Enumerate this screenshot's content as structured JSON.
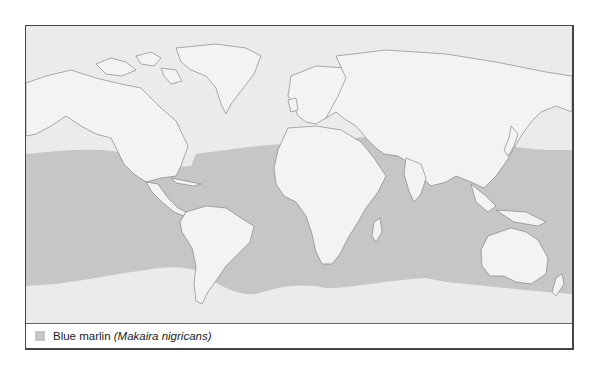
{
  "map": {
    "title": "",
    "colors": {
      "ocean": "#ebebeb",
      "range": "#c6c6c6",
      "land": "#f3f3f3",
      "coast": "#777777"
    }
  },
  "legend": {
    "items": [
      {
        "swatch_color": "#c6c6c6",
        "label": "Blue marlin",
        "scientific_name": "(Makaira nigricans)"
      }
    ]
  }
}
